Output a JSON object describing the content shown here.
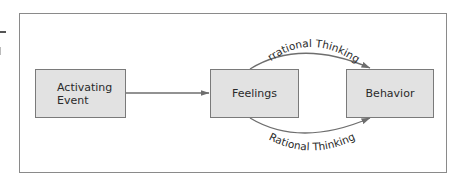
{
  "diagram": {
    "type": "flowchart",
    "nodes": [
      {
        "id": "activating_event",
        "label": "Activating\nEvent"
      },
      {
        "id": "feelings",
        "label": "Feelings"
      },
      {
        "id": "behavior",
        "label": "Behavior"
      }
    ],
    "edges": [
      {
        "from": "activating_event",
        "to": "feelings",
        "label": ""
      },
      {
        "from": "feelings",
        "to": "behavior",
        "label": "Irrational Thinking",
        "path": "curved-above"
      },
      {
        "from": "feelings",
        "to": "behavior",
        "label": "Rational Thinking",
        "path": "curved-below"
      }
    ],
    "colors": {
      "node_fill": "#e2e2e2",
      "node_border": "#7a7a7a",
      "line": "#6e6e6e",
      "frame": "#8a8a8a"
    }
  }
}
